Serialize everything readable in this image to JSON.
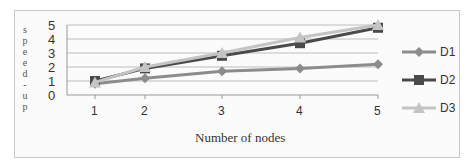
{
  "chart_data": {
    "type": "line",
    "title": "",
    "xlabel": "Number of nodes",
    "ylabel": "speed-up",
    "x": [
      1,
      2,
      3,
      4,
      5
    ],
    "categories": [
      "1",
      "2",
      "3",
      "4",
      "5"
    ],
    "yticks": [
      "0",
      "1",
      "2",
      "3",
      "4",
      "5"
    ],
    "ylim": [
      0,
      5
    ],
    "grid": true,
    "legend_position": "right",
    "series": [
      {
        "name": "D1",
        "values": [
          0.8,
          1.2,
          1.7,
          1.9,
          2.2
        ],
        "color": "#8c8c8c",
        "marker": "diamond"
      },
      {
        "name": "D2",
        "values": [
          1.0,
          1.9,
          2.8,
          3.7,
          4.8
        ],
        "color": "#4a4a4a",
        "marker": "square"
      },
      {
        "name": "D3",
        "values": [
          0.9,
          2.0,
          3.0,
          4.1,
          5.0
        ],
        "color": "#c4c4c4",
        "marker": "triangle"
      }
    ]
  },
  "ylabel_chars": [
    "s",
    "p",
    "e",
    "e",
    "d",
    "-",
    "u",
    "p"
  ],
  "legend": {
    "d1": "D1",
    "d2": "D2",
    "d3": "D3"
  }
}
